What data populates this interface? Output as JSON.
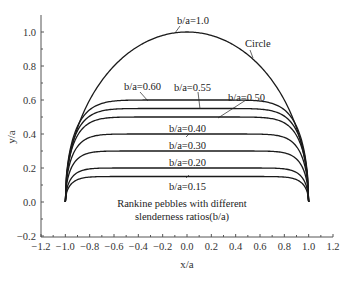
{
  "chart_data": {
    "type": "line",
    "title": "",
    "xlabel": "x/a",
    "ylabel": "y/a",
    "xlim": [
      -1.2,
      1.2
    ],
    "ylim": [
      -0.2,
      1.1
    ],
    "xticks": [
      "-1.2",
      "-1.0",
      "-0.8",
      "-0.6",
      "-0.4",
      "-0.2",
      "0.0",
      "0.2",
      "0.4",
      "0.6",
      "0.8",
      "1.0",
      "1.2"
    ],
    "yticks": [
      "-0.2",
      "0.0",
      "0.2",
      "0.4",
      "0.6",
      "0.8",
      "1.0"
    ],
    "grid": false,
    "series": [
      {
        "name": "b/a=1.0",
        "peak": 1.0,
        "note": "Circle"
      },
      {
        "name": "b/a=0.60",
        "peak": 0.6
      },
      {
        "name": "b/a=0.55",
        "peak": 0.55
      },
      {
        "name": "b/a=0.50",
        "peak": 0.5
      },
      {
        "name": "b/a=0.40",
        "peak": 0.4
      },
      {
        "name": "b/a=0.30",
        "peak": 0.3
      },
      {
        "name": "b/a=0.20",
        "peak": 0.2
      },
      {
        "name": "b/a=0.15",
        "peak": 0.15
      }
    ],
    "annotations": [
      "Circle",
      "Rankine pebbles with different",
      "slenderness ratios(b/a)"
    ]
  },
  "labels": {
    "circle": "Circle",
    "b10": "b/a=1.0",
    "b060": "b/a=0.60",
    "b055": "b/a=0.55",
    "b050": "b/a=0.50",
    "b040": "b/a=0.40",
    "b030": "b/a=0.30",
    "b020": "b/a=0.20",
    "b015": "b/a=0.15",
    "caption1": "Rankine pebbles with different",
    "caption2": "slenderness ratios(b/a)",
    "xlabel": "x/a",
    "ylabel": "y/a"
  }
}
